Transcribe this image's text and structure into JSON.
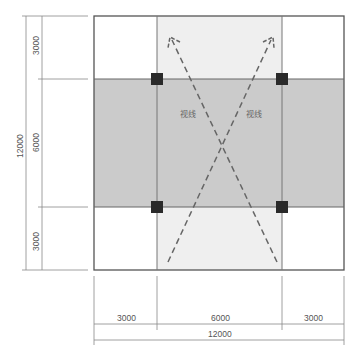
{
  "diagram": {
    "type": "floor-plan-sightline",
    "colors": {
      "outline": "#555555",
      "central_band": "#cccccc",
      "vertical_band": "#eeeeee",
      "column": "#2a2a2a",
      "sightline": "#666666",
      "dimension": "#777777"
    },
    "labels": {
      "sightline_left": "视线",
      "sightline_right": "视线"
    },
    "dimensions": {
      "left_inner": [
        "3000",
        "6000",
        "3000"
      ],
      "left_outer": "12000",
      "bottom_inner": [
        "3000",
        "6000",
        "3000"
      ],
      "bottom_outer": "12000"
    }
  }
}
